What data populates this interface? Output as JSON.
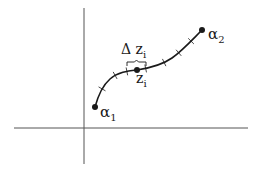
{
  "diagram": {
    "title": "",
    "colors": {
      "stroke": "#1a1a1a",
      "axis": "#555555",
      "background": "#ffffff"
    },
    "axes": {
      "horizontal": {
        "x1": 14,
        "y": 128,
        "x2": 248
      },
      "vertical": {
        "x": 84,
        "y1": 8,
        "y2": 164
      }
    },
    "curve": {
      "path": "M95,107 C98,96 102,86 110,79 C118,72 128,71 137,70 C150,68 162,65 172,58 C182,51 192,40 202,30",
      "ticks": [
        {
          "x": 102,
          "y": 89
        },
        {
          "x": 115,
          "y": 75
        },
        {
          "x": 127,
          "y": 71
        },
        {
          "x": 146,
          "y": 69
        },
        {
          "x": 164,
          "y": 62
        },
        {
          "x": 179,
          "y": 53
        },
        {
          "x": 191,
          "y": 41
        }
      ]
    },
    "points": [
      {
        "id": "alpha1",
        "x": 95,
        "y": 107
      },
      {
        "id": "zi",
        "x": 137,
        "y": 70
      },
      {
        "id": "alpha2",
        "x": 202,
        "y": 30
      }
    ],
    "brace": {
      "x1": 127,
      "x2": 146,
      "y": 62
    },
    "labels": {
      "alpha1": {
        "main": "α",
        "sub": "1"
      },
      "alpha2": {
        "main": "α",
        "sub": "2"
      },
      "delta_zi": {
        "main": "Δ z",
        "sub": "i"
      },
      "zi": {
        "main": "z",
        "sub": "i"
      }
    }
  }
}
